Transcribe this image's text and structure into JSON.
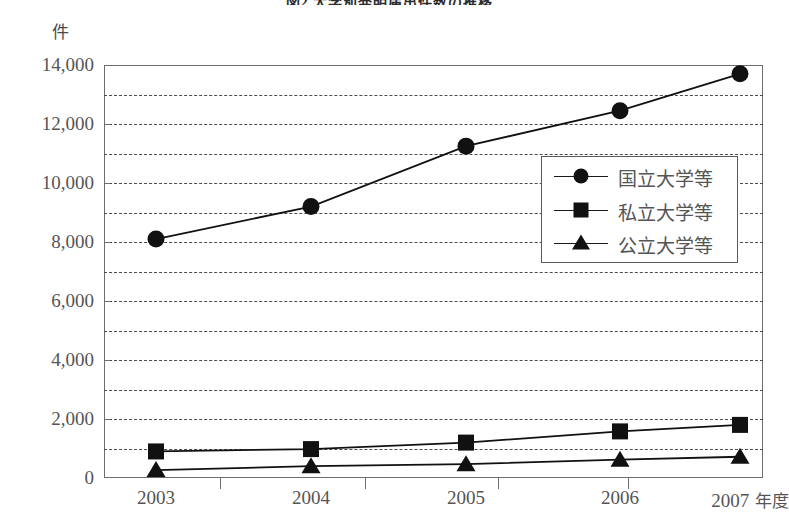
{
  "figure": {
    "title": "図2 大学別発明届出件数の推移",
    "unit_label": "件"
  },
  "legend": {
    "position": "inside-right-upper",
    "items": [
      {
        "label": "国立大学等",
        "marker": "circle"
      },
      {
        "label": "私立大学等",
        "marker": "square"
      },
      {
        "label": "公立大学等",
        "marker": "triangle"
      }
    ]
  },
  "axes": {
    "y_ticks": [
      "0",
      "2,000",
      "4,000",
      "6,000",
      "8,000",
      "10,000",
      "12,000",
      "14,000"
    ],
    "y_tick_values": [
      0,
      2000,
      4000,
      6000,
      8000,
      10000,
      12000,
      14000
    ],
    "y_gridlines": [
      1000,
      3000,
      5000,
      7000,
      9000,
      11000,
      13000
    ],
    "x_labels": [
      "2003",
      "2004",
      "2005",
      "2006",
      "2007"
    ],
    "x_suffix": " 年度"
  },
  "chart_data": {
    "type": "line",
    "title": "図2 大学別発明届出件数の推移",
    "xlabel": "年度",
    "ylabel": "件",
    "categories": [
      "2003",
      "2004",
      "2005",
      "2006",
      "2007"
    ],
    "series": [
      {
        "name": "国立大学等",
        "marker": "circle",
        "values": [
          8100,
          9200,
          11250,
          12450,
          13700
        ]
      },
      {
        "name": "私立大学等",
        "marker": "square",
        "values": [
          900,
          980,
          1200,
          1580,
          1800
        ]
      },
      {
        "name": "公立大学等",
        "marker": "triangle",
        "values": [
          270,
          400,
          470,
          620,
          720
        ]
      }
    ],
    "ylim": [
      0,
      14000
    ],
    "ytick_step": 2000,
    "grid": true,
    "grid_style": "dashed horizontal every 1000",
    "legend_position": "center-right",
    "line_color": "#111111"
  }
}
